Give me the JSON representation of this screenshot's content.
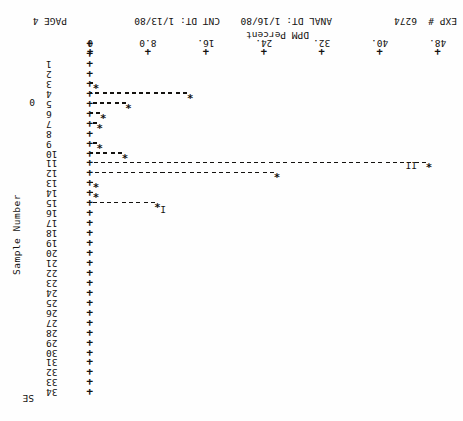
{
  "page": {
    "width": 463,
    "height": 421,
    "orientation_note": "printout scanned upside-down (rotated 180 degrees)",
    "ink_color": "#14120f",
    "background_color": "#fefefe"
  },
  "chart_data": {
    "type": "bar",
    "title": "",
    "xlabel": "DPM Percent",
    "ylabel": "Sample Number",
    "orientation": "horizontal",
    "xlim": [
      0,
      48
    ],
    "xticks": [
      0,
      8.0,
      16,
      24,
      32,
      40,
      48
    ],
    "xtick_labels": [
      "0",
      "8.0",
      "16.",
      "24.",
      "32.",
      "40.",
      "48."
    ],
    "grid": false,
    "legend": "",
    "categories": [
      1,
      2,
      3,
      4,
      5,
      6,
      7,
      8,
      9,
      10,
      11,
      12,
      13,
      14,
      15,
      16,
      17,
      18,
      19,
      20,
      21,
      22,
      23,
      24,
      25,
      26,
      27,
      28,
      29,
      30,
      31,
      32,
      33,
      34
    ],
    "values": [
      0.0,
      0.0,
      1.0,
      14.0,
      5.5,
      2.0,
      1.5,
      0.0,
      1.5,
      5.0,
      47.0,
      26.0,
      1.0,
      1.0,
      9.5,
      0.0,
      0.0,
      0.0,
      0.0,
      0.0,
      0.0,
      0.0,
      0.0,
      0.0,
      0.0,
      0.0,
      0.0,
      0.0,
      0.0,
      0.0,
      0.0,
      0.0,
      0.0,
      0.0
    ],
    "annotations": [
      {
        "label": "I",
        "sample": 15,
        "note": "peak group I marker"
      },
      {
        "label": "II",
        "sample": 11,
        "note": "peak group II marker"
      },
      {
        "label": "0",
        "sample": 4,
        "note": "zero reference flag"
      },
      {
        "label": "SE",
        "sample": 34,
        "note": "standard error row marker"
      }
    ],
    "marker_char": "*",
    "bar_char": "-",
    "tick_char": "+"
  },
  "ylabels": [
    "1",
    "2",
    "3",
    "4",
    "5",
    "6",
    "7",
    "8",
    "9",
    "10",
    "11",
    "12",
    "13",
    "14",
    "15",
    "16",
    "17",
    "18",
    "19",
    "20",
    "21",
    "22",
    "23",
    "24",
    "25",
    "26",
    "27",
    "28",
    "29",
    "30",
    "31",
    "32",
    "33",
    "34"
  ],
  "axis": {
    "y_title": "Sample Number",
    "x_title": "DPM Percent",
    "se_label": "SE",
    "zero_label": "0"
  },
  "group_labels": {
    "one": "I",
    "two": "II"
  },
  "footer": {
    "exp_label": "EXP #",
    "exp_value": "6274",
    "anal_dt": "ANAL DT: 1/16/80",
    "cnt_dt": "CNT DT: 1/13/80",
    "page": "PAGE 4"
  }
}
